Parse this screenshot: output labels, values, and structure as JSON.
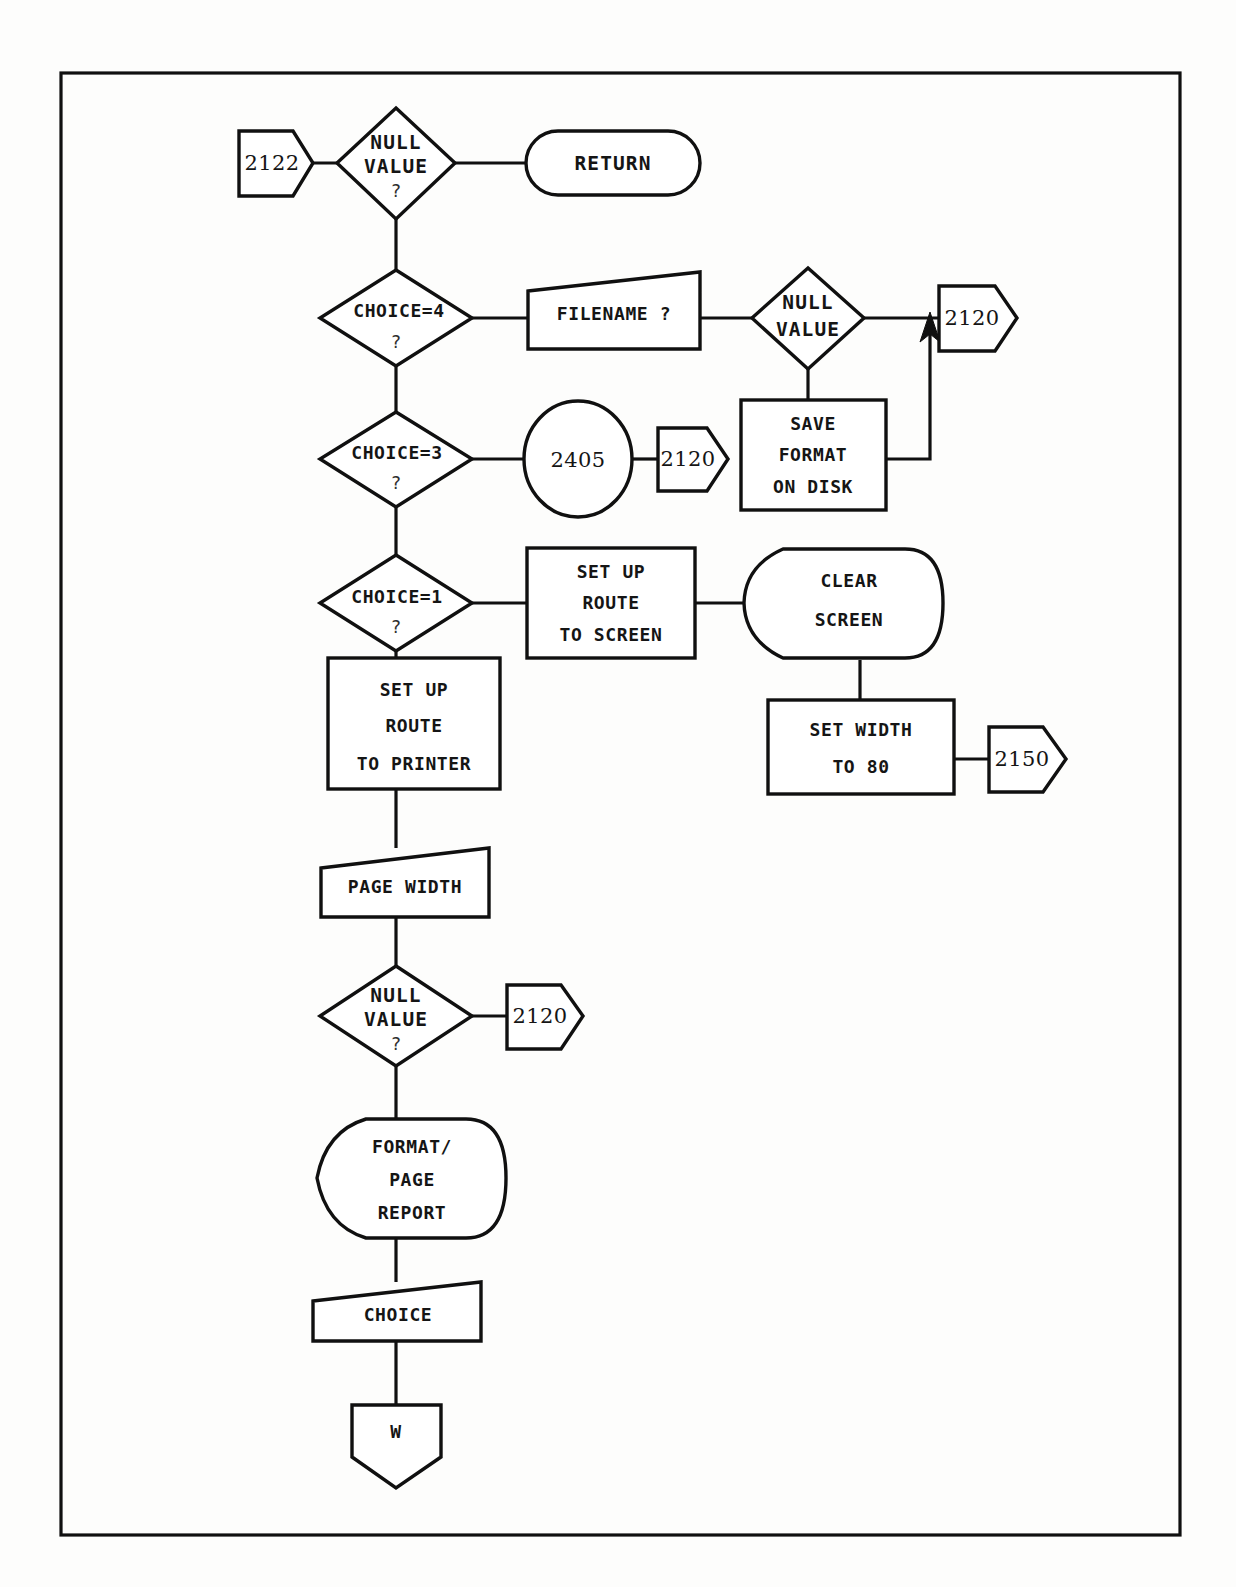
{
  "document": {
    "kind": "flowchart",
    "title": "Format / Page routine flowchart",
    "page_border_color": "#101010",
    "background_color": "#fdfdfc",
    "ink_color": "#151515"
  },
  "nodes": {
    "entry_2122": {
      "label": "2122",
      "shape": "connector-pentagon-right"
    },
    "null_value_1": {
      "line1": "NULL",
      "line2": "VALUE",
      "line3": "?",
      "shape": "decision-diamond"
    },
    "return_terminal": {
      "label": "RETURN",
      "shape": "terminator-stadium"
    },
    "choice_4": {
      "line1": "CHOICE=4",
      "line2": "?",
      "shape": "decision-diamond"
    },
    "filename_input": {
      "label": "FILENAME ?",
      "shape": "input-parallelogram"
    },
    "null_value_2": {
      "line1": "NULL",
      "line2": "VALUE",
      "shape": "decision-diamond"
    },
    "exit_2120_a": {
      "label": "2120",
      "shape": "connector-pentagon-right"
    },
    "save_format": {
      "line1": "SAVE",
      "line2": "FORMAT",
      "line3": "ON DISK",
      "shape": "process-rect"
    },
    "choice_3": {
      "line1": "CHOICE=3",
      "line2": "?",
      "shape": "decision-diamond"
    },
    "call_2405": {
      "label": "2405",
      "shape": "connector-circle"
    },
    "exit_2120_b": {
      "label": "2120",
      "shape": "connector-pentagon-right"
    },
    "choice_1": {
      "line1": "CHOICE=1",
      "line2": "?",
      "shape": "decision-diamond"
    },
    "route_screen": {
      "line1": "SET UP",
      "line2": "ROUTE",
      "line3": "TO SCREEN",
      "shape": "process-rect"
    },
    "clear_screen": {
      "line1": "CLEAR",
      "line2": "SCREEN",
      "shape": "subroutine-hex"
    },
    "set_width_80": {
      "line1": "SET WIDTH",
      "line2": "TO 80",
      "shape": "process-rect"
    },
    "exit_2150": {
      "label": "2150",
      "shape": "connector-pentagon-right"
    },
    "route_printer": {
      "line1": "SET UP",
      "line2": "ROUTE",
      "line3": "TO PRINTER",
      "shape": "process-rect"
    },
    "page_width_input": {
      "label": "PAGE WIDTH",
      "shape": "input-parallelogram"
    },
    "null_value_3": {
      "line1": "NULL",
      "line2": "VALUE",
      "line3": "?",
      "shape": "decision-diamond"
    },
    "exit_2120_c": {
      "label": "2120",
      "shape": "connector-pentagon-right"
    },
    "format_page_report": {
      "line1": "FORMAT/",
      "line2": "PAGE",
      "line3": "REPORT",
      "shape": "subroutine-hex"
    },
    "choice_input": {
      "label": "CHOICE",
      "shape": "input-parallelogram"
    },
    "exit_w": {
      "label": "W",
      "shape": "connector-pentagon-down"
    }
  }
}
